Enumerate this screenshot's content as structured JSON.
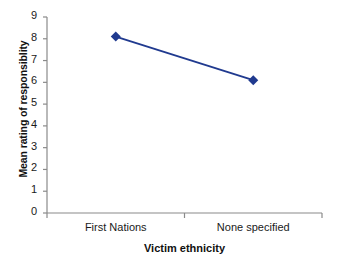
{
  "chart_data": {
    "type": "line",
    "title": "",
    "xlabel": "Victim ethnicity",
    "ylabel": "Mean rating of responsiblity",
    "categories": [
      "First Nations",
      "None specified"
    ],
    "values": [
      8.1,
      6.1
    ],
    "series": [
      {
        "name": "Mean rating of responsiblity",
        "values": [
          8.1,
          6.1
        ],
        "color": "#203A8F",
        "marker": "diamond"
      }
    ],
    "ylim": [
      0,
      9
    ],
    "yticks": [
      0,
      1,
      2,
      3,
      4,
      5,
      6,
      7,
      8,
      9
    ],
    "ytick_labels": [
      "0",
      "1",
      "2",
      "3",
      "4",
      "5",
      "6",
      "7",
      "8",
      "9"
    ],
    "grid": false,
    "legend": false,
    "legend_position": "none",
    "axis_color": "#8a8a8a",
    "text_color": "#101010"
  }
}
